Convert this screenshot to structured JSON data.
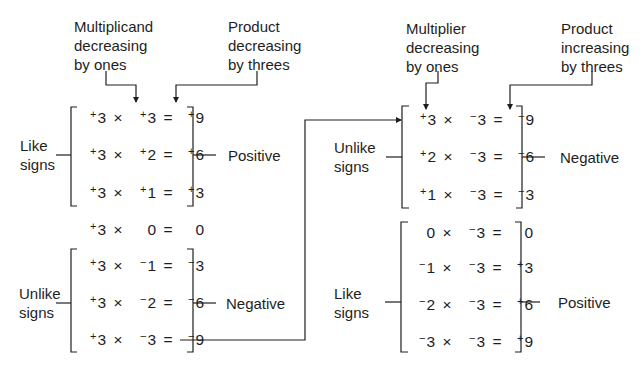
{
  "left": {
    "annotation_multiplicand": [
      "Multiplicand",
      "decreasing",
      "by ones"
    ],
    "annotation_product": [
      "Product",
      "decreasing",
      "by threes"
    ],
    "group_like": {
      "side_label": [
        "Like",
        "signs"
      ],
      "result_label": "Positive",
      "rows": [
        {
          "a_sign": "+",
          "a": "3",
          "b_sign": "+",
          "b": "3",
          "p_sign": "+",
          "p": "9"
        },
        {
          "a_sign": "+",
          "a": "3",
          "b_sign": "+",
          "b": "2",
          "p_sign": "+",
          "p": "6"
        },
        {
          "a_sign": "+",
          "a": "3",
          "b_sign": "+",
          "b": "1",
          "p_sign": "+",
          "p": "3"
        }
      ]
    },
    "zero_row": {
      "a_sign": "+",
      "a": "3",
      "b_sign": "",
      "b": "0",
      "p_sign": "",
      "p": "0"
    },
    "group_unlike": {
      "side_label": [
        "Unlike",
        "signs"
      ],
      "result_label": "Negative",
      "rows": [
        {
          "a_sign": "+",
          "a": "3",
          "b_sign": "−",
          "b": "1",
          "p_sign": "−",
          "p": "3"
        },
        {
          "a_sign": "+",
          "a": "3",
          "b_sign": "−",
          "b": "2",
          "p_sign": "−",
          "p": "6"
        },
        {
          "a_sign": "+",
          "a": "3",
          "b_sign": "−",
          "b": "3",
          "p_sign": "−",
          "p": "9"
        }
      ]
    }
  },
  "right": {
    "annotation_multiplier": [
      "Multiplier",
      "decreasing",
      "by ones"
    ],
    "annotation_product": [
      "Product",
      "increasing",
      "by threes"
    ],
    "group_unlike": {
      "side_label": [
        "Unlike",
        "signs"
      ],
      "result_label": "Negative",
      "rows": [
        {
          "a_sign": "+",
          "a": "3",
          "b_sign": "−",
          "b": "3",
          "p_sign": "−",
          "p": "9"
        },
        {
          "a_sign": "+",
          "a": "2",
          "b_sign": "−",
          "b": "3",
          "p_sign": "−",
          "p": "6"
        },
        {
          "a_sign": "+",
          "a": "1",
          "b_sign": "−",
          "b": "3",
          "p_sign": "−",
          "p": "3"
        }
      ]
    },
    "group_like": {
      "side_label": [
        "Like",
        "signs"
      ],
      "result_label": "Positive",
      "rows": [
        {
          "a_sign": "",
          "a": "0",
          "b_sign": "−",
          "b": "3",
          "p_sign": "",
          "p": "0"
        },
        {
          "a_sign": "−",
          "a": "1",
          "b_sign": "−",
          "b": "3",
          "p_sign": "+",
          "p": "3"
        },
        {
          "a_sign": "−",
          "a": "2",
          "b_sign": "−",
          "b": "3",
          "p_sign": "+",
          "p": "6"
        },
        {
          "a_sign": "−",
          "a": "3",
          "b_sign": "−",
          "b": "3",
          "p_sign": "+",
          "p": "9"
        }
      ]
    }
  },
  "symbols": {
    "times": "×",
    "equals": "="
  },
  "colors": {
    "ink": "#1e1e1e",
    "background": "#ffffff"
  }
}
